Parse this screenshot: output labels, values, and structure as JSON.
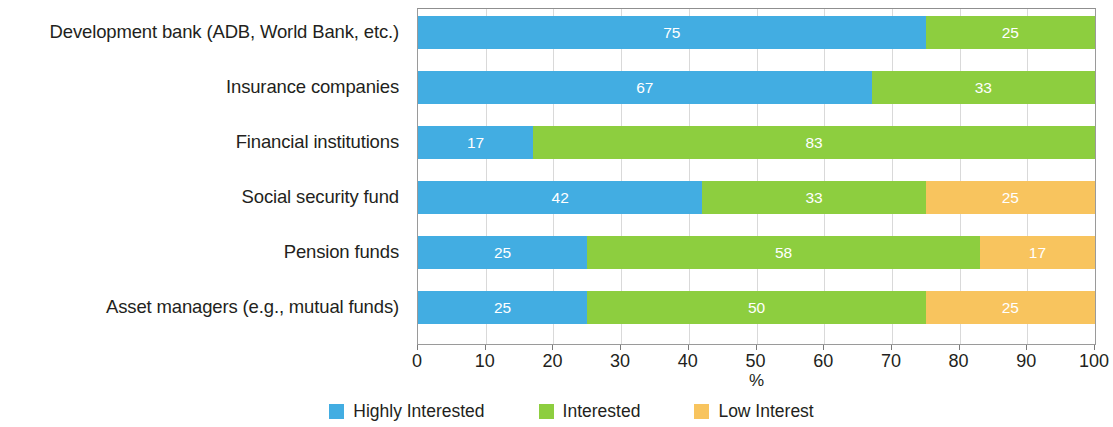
{
  "chart_data": {
    "type": "bar",
    "orientation": "horizontal",
    "stacked": true,
    "stack_total": 100,
    "title": "",
    "xlabel": "%",
    "ylabel": "",
    "xlim": [
      0,
      100
    ],
    "xticks": [
      0,
      10,
      20,
      30,
      40,
      50,
      60,
      70,
      80,
      90,
      100
    ],
    "xtick_labels": [
      "0",
      "10",
      "20",
      "30",
      "40",
      "50",
      "60",
      "70",
      "80",
      "90",
      "100"
    ],
    "grid": true,
    "legend_position": "bottom-center",
    "categories": [
      "Development bank (ADB, World Bank, etc.)",
      "Insurance companies",
      "Financial institutions",
      "Social security fund",
      "Pension funds",
      "Asset managers (e.g., mutual funds)"
    ],
    "series": [
      {
        "name": "Highly Interested",
        "color": "#42ADE2",
        "values": [
          75,
          67,
          17,
          42,
          25,
          25
        ],
        "labels": [
          "75",
          "67",
          "17",
          "42",
          "25",
          "25"
        ]
      },
      {
        "name": "Interested",
        "color": "#8DCE3F",
        "values": [
          25,
          33,
          83,
          33,
          58,
          50
        ],
        "labels": [
          "25",
          "33",
          "83",
          "33",
          "58",
          "50"
        ]
      },
      {
        "name": "Low Interest",
        "color": "#F8C45E",
        "values": [
          0,
          0,
          0,
          25,
          17,
          25
        ],
        "labels": [
          "",
          "",
          "",
          "25",
          "17",
          "25"
        ]
      }
    ]
  },
  "colors": {
    "highly_interested": "#42ADE2",
    "interested": "#8DCE3F",
    "low_interest": "#F8C45E",
    "axis": "#9a9a9a",
    "grid": "#d9d9d9",
    "text": "#231f20",
    "bar_label": "#ffffff",
    "background": "#ffffff"
  }
}
